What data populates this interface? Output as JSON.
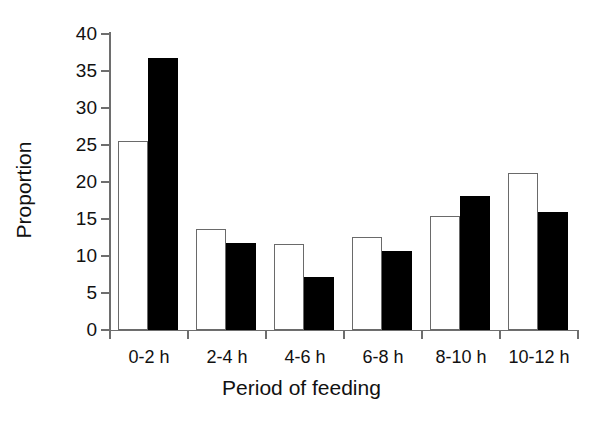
{
  "chart_data": {
    "type": "bar",
    "title": "",
    "xlabel": "Period of feeding",
    "ylabel": "Proportion",
    "categories": [
      "0-2 h",
      "2-4 h",
      "4-6 h",
      "6-8 h",
      "8-10 h",
      "10-12 h"
    ],
    "series": [
      {
        "name": "white",
        "fill": "#ffffff",
        "edge": "#6a6a6a",
        "values": [
          25.5,
          13.7,
          11.6,
          12.6,
          15.4,
          21.2
        ]
      },
      {
        "name": "black",
        "fill": "#000000",
        "edge": "#000000",
        "values": [
          36.7,
          11.7,
          7.2,
          10.7,
          18.1,
          16.0
        ]
      }
    ],
    "ylim": [
      0,
      40
    ],
    "yticks": [
      0,
      5,
      10,
      15,
      20,
      25,
      30,
      35,
      40
    ],
    "ytick_labels": [
      "0",
      "5",
      "10",
      "15",
      "20",
      "25",
      "30",
      "35",
      "40"
    ],
    "grid": false,
    "legend": "none",
    "axis_color": "#6e6e6e",
    "text_color": "#111111"
  }
}
